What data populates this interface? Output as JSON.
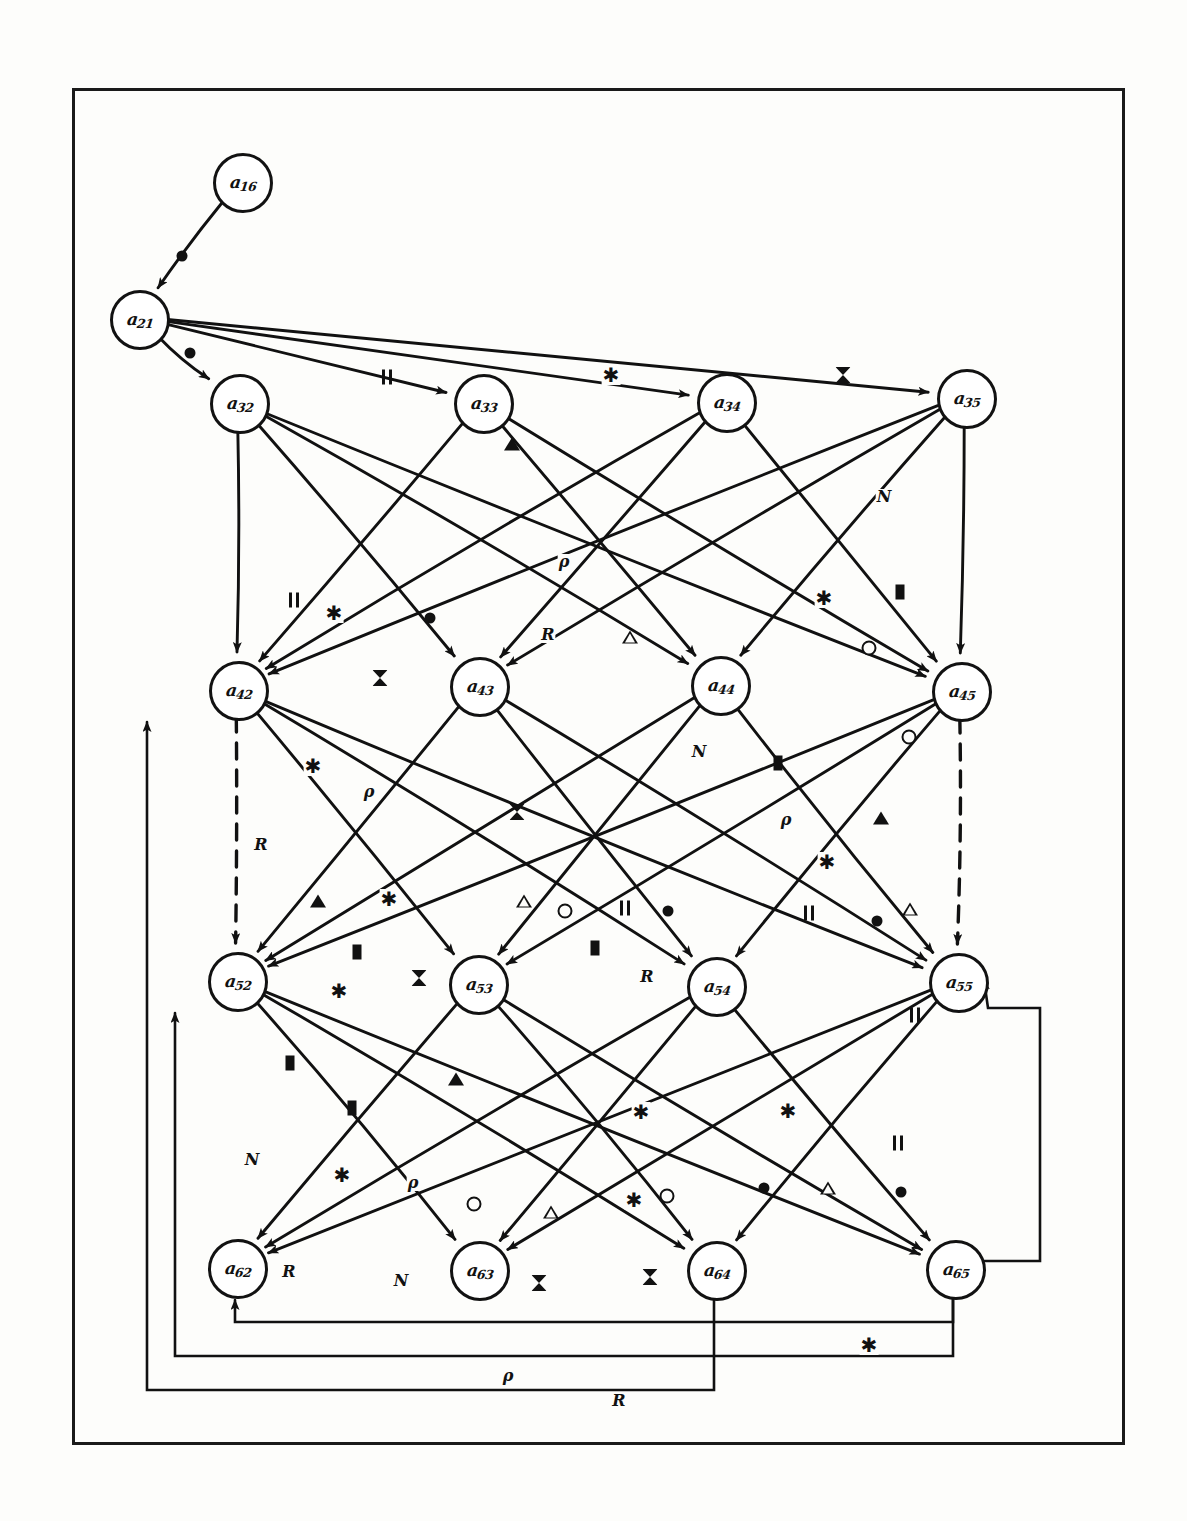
{
  "figure": {
    "kind": "hand-drawn directed signal-flow graph",
    "border_color": "#1a1a1a",
    "ink_color": "#111111",
    "paper_color": "#fdfdfb"
  },
  "nodes": [
    {
      "id": "a16",
      "base": "a",
      "sub": "16",
      "x": 240,
      "y": 180
    },
    {
      "id": "a21",
      "base": "a",
      "sub": "21",
      "x": 137,
      "y": 317
    },
    {
      "id": "a32",
      "base": "a",
      "sub": "32",
      "x": 237,
      "y": 401
    },
    {
      "id": "a33",
      "base": "a",
      "sub": "33",
      "x": 481,
      "y": 401
    },
    {
      "id": "a34",
      "base": "a",
      "sub": "34",
      "x": 724,
      "y": 400
    },
    {
      "id": "a35",
      "base": "a",
      "sub": "35",
      "x": 964,
      "y": 396
    },
    {
      "id": "a42",
      "base": "a",
      "sub": "42",
      "x": 236,
      "y": 688
    },
    {
      "id": "a43",
      "base": "a",
      "sub": "43",
      "x": 477,
      "y": 684
    },
    {
      "id": "a44",
      "base": "a",
      "sub": "44",
      "x": 718,
      "y": 683
    },
    {
      "id": "a45",
      "base": "a",
      "sub": "45",
      "x": 959,
      "y": 689
    },
    {
      "id": "a52",
      "base": "a",
      "sub": "52",
      "x": 235,
      "y": 979
    },
    {
      "id": "a53",
      "base": "a",
      "sub": "53",
      "x": 476,
      "y": 982
    },
    {
      "id": "a54",
      "base": "a",
      "sub": "54",
      "x": 714,
      "y": 984
    },
    {
      "id": "a55",
      "base": "a",
      "sub": "55",
      "x": 956,
      "y": 980
    },
    {
      "id": "a62",
      "base": "a",
      "sub": "62",
      "x": 235,
      "y": 1266
    },
    {
      "id": "a63",
      "base": "a",
      "sub": "63",
      "x": 477,
      "y": 1268
    },
    {
      "id": "a64",
      "base": "a",
      "sub": "64",
      "x": 714,
      "y": 1268
    },
    {
      "id": "a65",
      "base": "a",
      "sub": "65",
      "x": 953,
      "y": 1267
    }
  ],
  "edges": [
    {
      "from": "a16",
      "to": "a21",
      "style": "solid"
    },
    {
      "from": "a21",
      "to": "a32",
      "style": "solid"
    },
    {
      "from": "a21",
      "to": "a33",
      "style": "solid"
    },
    {
      "from": "a21",
      "to": "a34",
      "style": "solid"
    },
    {
      "from": "a21",
      "to": "a35",
      "style": "solid"
    },
    {
      "from": "a32",
      "to": "a42",
      "style": "solid"
    },
    {
      "from": "a32",
      "to": "a43",
      "style": "solid"
    },
    {
      "from": "a32",
      "to": "a44",
      "style": "solid"
    },
    {
      "from": "a32",
      "to": "a45",
      "style": "solid"
    },
    {
      "from": "a33",
      "to": "a42",
      "style": "solid"
    },
    {
      "from": "a33",
      "to": "a44",
      "style": "solid"
    },
    {
      "from": "a33",
      "to": "a45",
      "style": "solid"
    },
    {
      "from": "a34",
      "to": "a42",
      "style": "solid"
    },
    {
      "from": "a34",
      "to": "a43",
      "style": "solid"
    },
    {
      "from": "a34",
      "to": "a45",
      "style": "solid"
    },
    {
      "from": "a35",
      "to": "a42",
      "style": "solid"
    },
    {
      "from": "a35",
      "to": "a43",
      "style": "solid"
    },
    {
      "from": "a35",
      "to": "a44",
      "style": "solid"
    },
    {
      "from": "a35",
      "to": "a45",
      "style": "solid"
    },
    {
      "from": "a42",
      "to": "a53",
      "style": "solid"
    },
    {
      "from": "a42",
      "to": "a54",
      "style": "solid"
    },
    {
      "from": "a42",
      "to": "a55",
      "style": "solid"
    },
    {
      "from": "a43",
      "to": "a52",
      "style": "solid"
    },
    {
      "from": "a43",
      "to": "a54",
      "style": "solid"
    },
    {
      "from": "a43",
      "to": "a55",
      "style": "solid"
    },
    {
      "from": "a44",
      "to": "a52",
      "style": "solid"
    },
    {
      "from": "a44",
      "to": "a53",
      "style": "solid"
    },
    {
      "from": "a44",
      "to": "a55",
      "style": "solid"
    },
    {
      "from": "a45",
      "to": "a52",
      "style": "solid"
    },
    {
      "from": "a45",
      "to": "a53",
      "style": "solid"
    },
    {
      "from": "a45",
      "to": "a54",
      "style": "solid"
    },
    {
      "from": "a42",
      "to": "a52",
      "style": "dashed"
    },
    {
      "from": "a45",
      "to": "a55",
      "style": "dashed"
    },
    {
      "from": "a52",
      "to": "a63",
      "style": "solid"
    },
    {
      "from": "a52",
      "to": "a64",
      "style": "solid"
    },
    {
      "from": "a52",
      "to": "a65",
      "style": "solid"
    },
    {
      "from": "a53",
      "to": "a62",
      "style": "solid"
    },
    {
      "from": "a53",
      "to": "a64",
      "style": "solid"
    },
    {
      "from": "a53",
      "to": "a65",
      "style": "solid"
    },
    {
      "from": "a54",
      "to": "a62",
      "style": "solid"
    },
    {
      "from": "a54",
      "to": "a63",
      "style": "solid"
    },
    {
      "from": "a54",
      "to": "a65",
      "style": "solid"
    },
    {
      "from": "a55",
      "to": "a62",
      "style": "solid"
    },
    {
      "from": "a55",
      "to": "a63",
      "style": "solid"
    },
    {
      "from": "a55",
      "to": "a64",
      "style": "solid"
    },
    {
      "from": "a65",
      "to": "a62",
      "style": "feedback"
    },
    {
      "from": "a65",
      "to": "a52",
      "style": "feedback"
    },
    {
      "from": "a64",
      "to": "a42",
      "style": "feedback"
    },
    {
      "from": "a65",
      "to": "a55",
      "style": "feedback"
    }
  ],
  "edge_markers": [
    {
      "glyph": "●",
      "name": "filled-circle",
      "kind": "dot",
      "x": 182,
      "y": 256
    },
    {
      "glyph": "●",
      "name": "filled-circle",
      "kind": "dot",
      "x": 190,
      "y": 353
    },
    {
      "glyph": "||",
      "name": "double-bar",
      "kind": "bar2",
      "x": 388,
      "y": 377
    },
    {
      "glyph": "✱",
      "name": "asterisk",
      "kind": "star",
      "x": 611,
      "y": 375
    },
    {
      "glyph": "⧓",
      "name": "bowtie",
      "kind": "bow",
      "x": 843,
      "y": 375
    },
    {
      "glyph": "▲",
      "name": "filled-triangle",
      "kind": "tri-f",
      "x": 512,
      "y": 444
    },
    {
      "glyph": "N",
      "name": "letter-n",
      "kind": "text",
      "x": 884,
      "y": 497
    },
    {
      "glyph": "ρ",
      "name": "rho",
      "kind": "text",
      "x": 564,
      "y": 562
    },
    {
      "glyph": "||",
      "name": "double-bar",
      "kind": "bar2",
      "x": 295,
      "y": 600
    },
    {
      "glyph": "✱",
      "name": "asterisk",
      "kind": "star",
      "x": 334,
      "y": 613
    },
    {
      "glyph": "●",
      "name": "filled-circle",
      "kind": "dot",
      "x": 430,
      "y": 618
    },
    {
      "glyph": "✱",
      "name": "asterisk",
      "kind": "star",
      "x": 824,
      "y": 598
    },
    {
      "glyph": "▮",
      "name": "filled-rect",
      "kind": "rect",
      "x": 900,
      "y": 592
    },
    {
      "glyph": "R",
      "name": "letter-r",
      "kind": "text",
      "x": 548,
      "y": 635
    },
    {
      "glyph": "△",
      "name": "open-triangle",
      "kind": "tri-o",
      "x": 630,
      "y": 637
    },
    {
      "glyph": "○",
      "name": "open-circle",
      "kind": "ring",
      "x": 869,
      "y": 648
    },
    {
      "glyph": "⧓",
      "name": "bowtie",
      "kind": "bow",
      "x": 380,
      "y": 678
    },
    {
      "glyph": "○",
      "name": "open-circle",
      "kind": "ring",
      "x": 909,
      "y": 737
    },
    {
      "glyph": "N",
      "name": "letter-n",
      "kind": "text",
      "x": 699,
      "y": 752
    },
    {
      "glyph": "✱",
      "name": "asterisk",
      "kind": "star",
      "x": 313,
      "y": 766
    },
    {
      "glyph": "ρ",
      "name": "rho",
      "kind": "text",
      "x": 369,
      "y": 792
    },
    {
      "glyph": "⧓",
      "name": "bowtie",
      "kind": "bow",
      "x": 517,
      "y": 812
    },
    {
      "glyph": "▮",
      "name": "filled-rect",
      "kind": "rect",
      "x": 778,
      "y": 763
    },
    {
      "glyph": "ρ",
      "name": "rho",
      "kind": "text",
      "x": 786,
      "y": 820
    },
    {
      "glyph": "▲",
      "name": "filled-triangle",
      "kind": "tri-f",
      "x": 881,
      "y": 818
    },
    {
      "glyph": "R",
      "name": "letter-r",
      "kind": "text",
      "x": 261,
      "y": 845
    },
    {
      "glyph": "✱",
      "name": "asterisk",
      "kind": "star",
      "x": 827,
      "y": 862
    },
    {
      "glyph": "▲",
      "name": "filled-triangle",
      "kind": "tri-f",
      "x": 318,
      "y": 901
    },
    {
      "glyph": "✱",
      "name": "asterisk",
      "kind": "star",
      "x": 389,
      "y": 899
    },
    {
      "glyph": "△",
      "name": "open-triangle",
      "kind": "tri-o",
      "x": 524,
      "y": 901
    },
    {
      "glyph": "○",
      "name": "open-circle",
      "kind": "ring",
      "x": 565,
      "y": 911
    },
    {
      "glyph": "||",
      "name": "double-bar",
      "kind": "bar2",
      "x": 626,
      "y": 908
    },
    {
      "glyph": "●",
      "name": "filled-circle",
      "kind": "dot",
      "x": 668,
      "y": 911
    },
    {
      "glyph": "||",
      "name": "double-bar",
      "kind": "bar2",
      "x": 810,
      "y": 913
    },
    {
      "glyph": "●",
      "name": "filled-circle",
      "kind": "dot",
      "x": 877,
      "y": 921
    },
    {
      "glyph": "△",
      "name": "open-triangle",
      "kind": "tri-o",
      "x": 910,
      "y": 909
    },
    {
      "glyph": "▮",
      "name": "filled-rect",
      "kind": "rect",
      "x": 357,
      "y": 952
    },
    {
      "glyph": "⧓",
      "name": "bowtie",
      "kind": "bow",
      "x": 419,
      "y": 978
    },
    {
      "glyph": "▮",
      "name": "filled-rect",
      "kind": "rect",
      "x": 595,
      "y": 948
    },
    {
      "glyph": "R",
      "name": "letter-r",
      "kind": "text",
      "x": 647,
      "y": 977
    },
    {
      "glyph": "✱",
      "name": "asterisk",
      "kind": "star",
      "x": 339,
      "y": 991
    },
    {
      "glyph": "||",
      "name": "double-bar",
      "kind": "bar2",
      "x": 916,
      "y": 1015
    },
    {
      "glyph": "▮",
      "name": "filled-rect",
      "kind": "rect",
      "x": 290,
      "y": 1063
    },
    {
      "glyph": "▲",
      "name": "filled-triangle",
      "kind": "tri-f",
      "x": 456,
      "y": 1079
    },
    {
      "glyph": "▮",
      "name": "filled-rect",
      "kind": "rect",
      "x": 352,
      "y": 1108
    },
    {
      "glyph": "✱",
      "name": "asterisk",
      "kind": "star",
      "x": 641,
      "y": 1112
    },
    {
      "glyph": "✱",
      "name": "asterisk",
      "kind": "star",
      "x": 788,
      "y": 1111
    },
    {
      "glyph": "||",
      "name": "double-bar",
      "kind": "bar2",
      "x": 899,
      "y": 1143
    },
    {
      "glyph": "N",
      "name": "letter-n",
      "kind": "text",
      "x": 252,
      "y": 1160
    },
    {
      "glyph": "✱",
      "name": "asterisk",
      "kind": "star",
      "x": 342,
      "y": 1175
    },
    {
      "glyph": "ρ",
      "name": "rho",
      "kind": "text",
      "x": 413,
      "y": 1183
    },
    {
      "glyph": "○",
      "name": "open-circle",
      "kind": "ring",
      "x": 474,
      "y": 1204
    },
    {
      "glyph": "△",
      "name": "open-triangle",
      "kind": "tri-o",
      "x": 551,
      "y": 1212
    },
    {
      "glyph": "✱",
      "name": "asterisk",
      "kind": "star",
      "x": 634,
      "y": 1200
    },
    {
      "glyph": "○",
      "name": "open-circle",
      "kind": "ring",
      "x": 667,
      "y": 1196
    },
    {
      "glyph": "●",
      "name": "filled-circle",
      "kind": "dot",
      "x": 764,
      "y": 1188
    },
    {
      "glyph": "△",
      "name": "open-triangle",
      "kind": "tri-o",
      "x": 828,
      "y": 1188
    },
    {
      "glyph": "●",
      "name": "filled-circle",
      "kind": "dot",
      "x": 901,
      "y": 1192
    },
    {
      "glyph": "R",
      "name": "letter-r",
      "kind": "text",
      "x": 289,
      "y": 1272
    },
    {
      "glyph": "N",
      "name": "letter-n",
      "kind": "text",
      "x": 401,
      "y": 1281
    },
    {
      "glyph": "⧓",
      "name": "bowtie",
      "kind": "bow",
      "x": 539,
      "y": 1283
    },
    {
      "glyph": "⧓",
      "name": "bowtie",
      "kind": "bow",
      "x": 650,
      "y": 1277
    },
    {
      "glyph": "✱",
      "name": "asterisk",
      "kind": "star",
      "x": 869,
      "y": 1345
    },
    {
      "glyph": "ρ",
      "name": "rho",
      "kind": "text",
      "x": 508,
      "y": 1376
    },
    {
      "glyph": "R",
      "name": "letter-r",
      "kind": "text",
      "x": 619,
      "y": 1401
    }
  ],
  "legend": {
    "marker_names": [
      "filled-circle",
      "open-circle",
      "double-bar",
      "asterisk",
      "bowtie",
      "filled-triangle",
      "open-triangle",
      "filled-rect",
      "rho",
      "letter-r",
      "letter-n"
    ]
  }
}
